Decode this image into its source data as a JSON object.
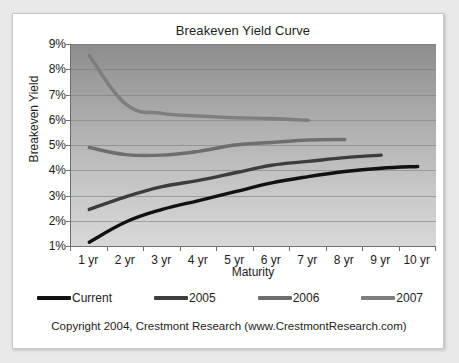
{
  "chart_data": {
    "type": "line",
    "title": "Breakeven Yield Curve",
    "xlabel": "Maturity",
    "ylabel": "Breakeven Yield",
    "categories": [
      "1 yr",
      "2 yr",
      "3 yr",
      "4 yr",
      "5 yr",
      "6 yr",
      "7 yr",
      "8 yr",
      "9 yr",
      "10 yr"
    ],
    "x": [
      1,
      2,
      3,
      4,
      5,
      6,
      7,
      8,
      9,
      10
    ],
    "ylim": [
      1,
      9
    ],
    "ytick_labels": [
      "9%",
      "8%",
      "7%",
      "6%",
      "5%",
      "4%",
      "3%",
      "2%",
      "1%"
    ],
    "ytick_values": [
      9,
      8,
      7,
      6,
      5,
      4,
      3,
      2,
      1
    ],
    "grid": true,
    "legend_position": "bottom",
    "series": [
      {
        "name": "Current",
        "color": "#111111",
        "values": [
          1.15,
          1.95,
          2.45,
          2.8,
          3.15,
          3.5,
          3.75,
          3.95,
          4.08,
          4.15
        ]
      },
      {
        "name": "2005",
        "color": "#3d3d3d",
        "values": [
          2.45,
          2.95,
          3.35,
          3.6,
          3.9,
          4.2,
          4.35,
          4.5,
          4.6,
          null
        ]
      },
      {
        "name": "2006",
        "color": "#6e6e6e",
        "values": [
          4.9,
          4.62,
          4.6,
          4.75,
          5.0,
          5.1,
          5.2,
          5.22,
          null,
          null
        ]
      },
      {
        "name": "2007",
        "color": "#7e7e7e",
        "values": [
          8.55,
          6.62,
          6.25,
          6.15,
          6.08,
          6.05,
          5.98,
          null,
          null,
          null
        ]
      }
    ]
  },
  "footer": {
    "copyright": "Copyright 2004, Crestmont Research (www.CrestmontResearch.com)"
  }
}
